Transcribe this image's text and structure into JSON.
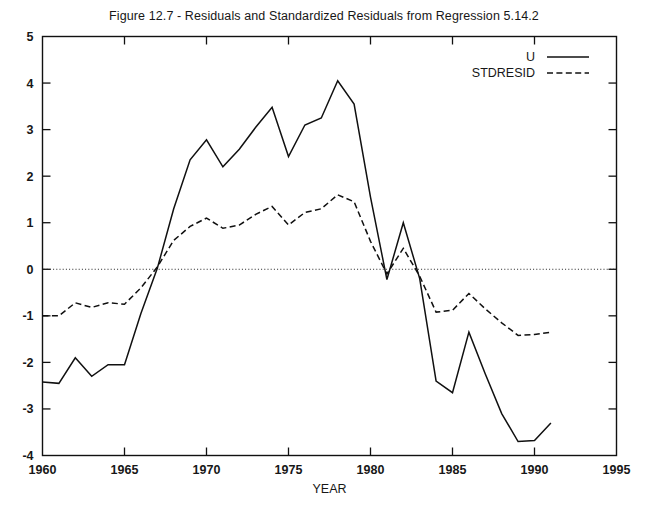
{
  "chart_data": {
    "type": "line",
    "title": "Figure 12.7 - Residuals and Standardized Residuals from Regression 5.14.2",
    "xlabel": "YEAR",
    "ylabel": "",
    "xlim": [
      1960,
      1995
    ],
    "ylim": [
      -4,
      5
    ],
    "xticks": [
      1960,
      1965,
      1970,
      1975,
      1980,
      1985,
      1990,
      1995
    ],
    "yticks": [
      -4,
      -3,
      -2,
      -1,
      0,
      1,
      2,
      3,
      4,
      5
    ],
    "grid": false,
    "zero_reference_line": 0,
    "legend_position": "top-right",
    "x": [
      1960,
      1961,
      1962,
      1963,
      1964,
      1965,
      1966,
      1967,
      1968,
      1969,
      1970,
      1971,
      1972,
      1973,
      1974,
      1975,
      1976,
      1977,
      1978,
      1979,
      1980,
      1981,
      1982,
      1983,
      1984,
      1985,
      1986,
      1987,
      1988,
      1989,
      1990,
      1991
    ],
    "series": [
      {
        "name": "U",
        "style": "solid",
        "values": [
          -2.42,
          -2.45,
          -1.9,
          -2.3,
          -2.05,
          -2.05,
          -0.95,
          0.02,
          1.3,
          2.35,
          2.78,
          2.2,
          2.58,
          3.05,
          3.48,
          2.42,
          3.1,
          3.25,
          4.05,
          3.55,
          1.55,
          -0.22,
          1.0,
          -0.2,
          -2.4,
          -2.65,
          -1.35,
          -2.25,
          -3.1,
          -3.7,
          -3.68,
          -3.3
        ]
      },
      {
        "name": "STDRESID",
        "style": "dashed",
        "values": [
          -1.0,
          -1.0,
          -0.72,
          -0.82,
          -0.72,
          -0.75,
          -0.4,
          0.05,
          0.62,
          0.92,
          1.1,
          0.88,
          0.95,
          1.18,
          1.35,
          0.95,
          1.22,
          1.3,
          1.6,
          1.45,
          0.6,
          -0.1,
          0.45,
          -0.15,
          -0.92,
          -0.88,
          -0.52,
          -0.85,
          -1.15,
          -1.42,
          -1.4,
          -1.35
        ]
      }
    ]
  },
  "legend": {
    "entries": [
      {
        "label": "U",
        "style": "solid"
      },
      {
        "label": "STDRESID",
        "style": "dashed"
      }
    ]
  },
  "axis_labels": {
    "x_name": "YEAR",
    "x_ticks": [
      "1960",
      "1965",
      "1970",
      "1975",
      "1980",
      "1985",
      "1990",
      "1995"
    ],
    "y_ticks": [
      "5",
      "4",
      "3",
      "2",
      "1",
      "0",
      "-1",
      "-2",
      "-3",
      "-4"
    ]
  },
  "colors": {
    "ink": "#101010",
    "background": "#ffffff"
  }
}
